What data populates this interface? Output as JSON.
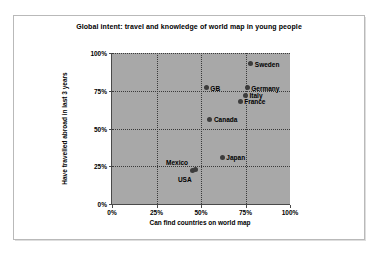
{
  "chart_data": {
    "type": "scatter",
    "title": "Global intent: travel and knowledge of world map in young people",
    "xlabel": "Can find countries on world map",
    "ylabel": "Have travelled abroad in last 3 years",
    "xlim": [
      0,
      100
    ],
    "ylim": [
      0,
      100
    ],
    "xticks": [
      "0%",
      "25%",
      "50%",
      "75%",
      "100%"
    ],
    "yticks": [
      "0%",
      "25%",
      "50%",
      "75%",
      "100%"
    ],
    "xtick_values": [
      0,
      25,
      50,
      75,
      100
    ],
    "ytick_values": [
      0,
      25,
      50,
      75,
      100
    ],
    "grid": true,
    "legend": "none",
    "plot_background": "#a8a8a8",
    "marker_color": "#3c3c3c",
    "points": [
      {
        "label": "Sweden",
        "x": 78,
        "y": 93,
        "label_pos": "right"
      },
      {
        "label": "Germany",
        "x": 76,
        "y": 77,
        "label_pos": "right"
      },
      {
        "label": "Italy",
        "x": 75,
        "y": 72,
        "label_pos": "right"
      },
      {
        "label": "France",
        "x": 72,
        "y": 68,
        "label_pos": "right"
      },
      {
        "label": "GB",
        "x": 53,
        "y": 77,
        "label_pos": "right"
      },
      {
        "label": "Canada",
        "x": 55,
        "y": 56,
        "label_pos": "right"
      },
      {
        "label": "Japan",
        "x": 62,
        "y": 31,
        "label_pos": "right"
      },
      {
        "label": "Mexico",
        "x": 45,
        "y": 22,
        "label_pos": "above-left"
      },
      {
        "label": "USA",
        "x": 47,
        "y": 23,
        "label_pos": "below-left"
      }
    ]
  }
}
